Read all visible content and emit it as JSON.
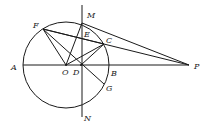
{
  "diagram": {
    "type": "geometry",
    "circle": {
      "center": "O",
      "cx": 66,
      "cy": 65,
      "r": 43
    },
    "points": {
      "A": {
        "x": 23,
        "y": 65,
        "label": "A",
        "lx": 11,
        "ly": 70
      },
      "B": {
        "x": 109,
        "y": 65,
        "label": "B",
        "lx": 111,
        "ly": 76
      },
      "O": {
        "x": 66,
        "y": 65,
        "label": "O",
        "lx": 62,
        "ly": 75
      },
      "D": {
        "x": 81,
        "y": 65,
        "label": "D",
        "lx": 73,
        "ly": 75
      },
      "P": {
        "x": 189,
        "y": 65,
        "label": "P",
        "lx": 194,
        "ly": 69
      },
      "M": {
        "x": 82,
        "y": 23,
        "label": "M",
        "lx": 87,
        "ly": 18
      },
      "N": {
        "x": 81,
        "y": 108,
        "label": "N",
        "lx": 84,
        "ly": 121
      },
      "F": {
        "x": 43,
        "y": 29,
        "label": "F",
        "lx": 33,
        "ly": 28
      },
      "C": {
        "x": 104,
        "y": 44,
        "label": "C",
        "lx": 106,
        "ly": 43
      },
      "E": {
        "x": 82,
        "y": 38,
        "label": "E",
        "lx": 84,
        "ly": 37
      },
      "G": {
        "x": 104,
        "y": 84,
        "label": "G",
        "lx": 106,
        "ly": 91
      }
    },
    "segments": [
      [
        "A",
        "P"
      ],
      [
        "F",
        "P"
      ],
      [
        "M",
        "P"
      ],
      [
        "F",
        "C"
      ],
      [
        "F",
        "O"
      ],
      [
        "F",
        "G"
      ],
      [
        "O",
        "M"
      ],
      [
        "O",
        "C"
      ],
      [
        "D",
        "C"
      ]
    ],
    "vertical_line": {
      "x": 82,
      "y1": 5,
      "y2": 117
    }
  }
}
